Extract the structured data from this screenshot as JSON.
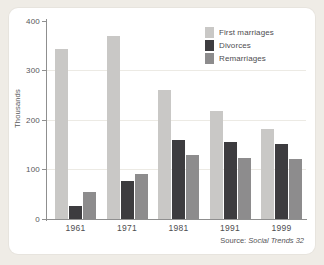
{
  "chart_data": {
    "type": "bar",
    "title": "",
    "subtitle": "",
    "xlabel": "",
    "ylabel": "Thousands",
    "ylim": [
      0,
      400
    ],
    "yticks": [
      0,
      100,
      200,
      300,
      400
    ],
    "grid": "horizontal",
    "legend_position": "top-right",
    "categories": [
      "1961",
      "1971",
      "1981",
      "1991",
      "1999"
    ],
    "series": [
      {
        "name": "First marriages",
        "color": "#c9c8c6",
        "values": [
          343,
          369,
          260,
          219,
          181
        ]
      },
      {
        "name": "Divorces",
        "color": "#3d3c3f",
        "values": [
          27,
          77,
          160,
          155,
          152
        ]
      },
      {
        "name": "Remarriages",
        "color": "#8d8c8d",
        "values": [
          55,
          90,
          130,
          124,
          121
        ]
      }
    ],
    "annotations": {
      "source_label": "Source:",
      "source_publication": "Social Trends 32"
    }
  },
  "axis": {
    "y_tick_labels": [
      "400",
      "300",
      "200",
      "100",
      "0"
    ],
    "y_title": "Thousands"
  },
  "colors": {
    "page_background": "#efece6",
    "card_background": "#ffffff",
    "axis": "#8f8f8f",
    "gridline": "#eceae4",
    "text": "#4e4d50"
  }
}
